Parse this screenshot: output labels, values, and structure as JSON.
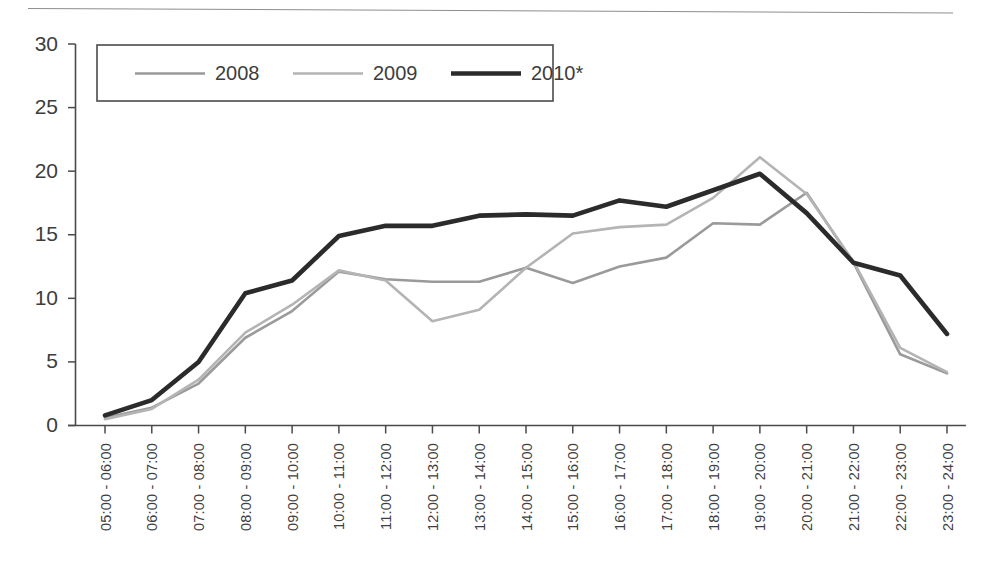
{
  "figure": {
    "top_rule": "horizontal-rule",
    "background_color": "#ffffff"
  },
  "chart_data": {
    "type": "line",
    "title": "",
    "subtitle": "",
    "xlabel": "",
    "ylabel": "",
    "ylim": [
      0,
      30
    ],
    "yticks": [
      0,
      5,
      10,
      15,
      20,
      25,
      30
    ],
    "grid": false,
    "legend_position": "top-left-inside",
    "categories": [
      "05:00 - 06:00",
      "06:00 - 07:00",
      "07:00 - 08:00",
      "08:00 - 09:00",
      "09:00 - 10:00",
      "10:00 - 11:00",
      "11:00 - 12:00",
      "12:00 - 13:00",
      "13:00 - 14:00",
      "14:00 - 15:00",
      "15:00 - 16:00",
      "16:00 - 17:00",
      "17:00 - 18:00",
      "18:00 - 19:00",
      "19:00 - 20:00",
      "20:00 - 21:00",
      "21:00 - 22:00",
      "22:00 - 23:00",
      "23:00 - 24:00"
    ],
    "series": [
      {
        "name": "2008",
        "color": "#9a9a9a",
        "width": 2.6,
        "values": [
          0.6,
          1.4,
          3.3,
          6.9,
          9.0,
          12.1,
          11.5,
          11.3,
          11.3,
          12.4,
          11.2,
          12.5,
          13.2,
          15.9,
          15.8,
          18.3,
          12.8,
          5.6,
          4.1
        ]
      },
      {
        "name": "2009",
        "color": "#b4b4b4",
        "width": 2.6,
        "values": [
          0.5,
          1.3,
          3.6,
          7.3,
          9.5,
          12.2,
          11.4,
          8.2,
          9.1,
          12.4,
          15.1,
          15.6,
          15.8,
          17.9,
          21.1,
          18.2,
          12.9,
          6.1,
          4.2
        ]
      },
      {
        "name": "2010*",
        "color": "#2b2b2b",
        "width": 4.6,
        "values": [
          0.8,
          2.0,
          5.0,
          10.4,
          11.4,
          14.9,
          15.7,
          15.7,
          16.5,
          16.6,
          16.5,
          17.7,
          17.2,
          18.5,
          19.8,
          16.7,
          12.8,
          11.8,
          7.2
        ]
      }
    ],
    "legend_entries": [
      {
        "label": "2008",
        "color": "#9a9a9a",
        "width": 2.6
      },
      {
        "label": "2009",
        "color": "#b4b4b4",
        "width": 2.6
      },
      {
        "label": "2010*",
        "color": "#2b2b2b",
        "width": 4.6
      }
    ]
  }
}
